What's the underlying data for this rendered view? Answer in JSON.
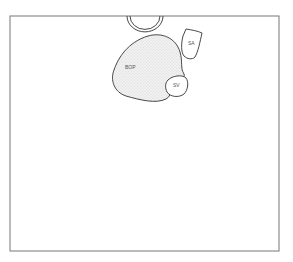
{
  "diagram": {
    "type": "anatomical-sketch",
    "labels": {
      "bop": "BOP",
      "sa": "SA",
      "sv": "SV"
    },
    "colors": {
      "stroke": "#333333",
      "frame": "#777777",
      "fill": "#e6e6e6"
    }
  }
}
